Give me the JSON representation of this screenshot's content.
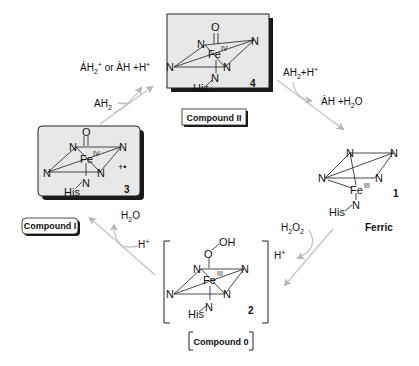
{
  "diagram": {
    "type": "catalytic-cycle",
    "arrow_color": "#c8c8c8",
    "box_fill": "#e8e8e8",
    "compounds": [
      {
        "id": "4",
        "number": "4",
        "label": "Compound II",
        "oxidation_state": "IV",
        "axial_top": "O",
        "axial_bottom": "N",
        "proximal_ligand": "His",
        "equatorial": [
          "N",
          "N",
          "N",
          "N"
        ],
        "metal": "Fe",
        "boxed": true
      },
      {
        "id": "1",
        "number": "1",
        "label": "Ferric",
        "oxidation_state": "III",
        "axial_bottom": "N",
        "proximal_ligand": "His",
        "equatorial": [
          "N",
          "N",
          "N",
          "N"
        ],
        "metal": "Fe",
        "boxed": false
      },
      {
        "id": "2",
        "number": "2",
        "label": "Compound 0",
        "oxidation_state": "III",
        "axial_top": "O",
        "axial_top_group": "OH",
        "axial_bottom": "N",
        "proximal_ligand": "His",
        "equatorial": [
          "N",
          "N",
          "N",
          "N"
        ],
        "metal": "Fe",
        "bracketed": true
      },
      {
        "id": "3",
        "number": "3",
        "label": "Compound I",
        "oxidation_state": "IV",
        "radical_cation": "+•",
        "axial_top": "O",
        "axial_bottom": "N",
        "proximal_ligand": "His",
        "equatorial": [
          "N",
          "N",
          "N",
          "N"
        ],
        "metal": "Fe",
        "boxed": true
      }
    ],
    "steps": [
      {
        "from": "1",
        "to": "2",
        "in": "H2O2",
        "out": "H+"
      },
      {
        "from": "2",
        "to": "3",
        "in": "H+",
        "out": "H2O"
      },
      {
        "from": "3",
        "to": "4",
        "in": "AH2",
        "out": "ȦH2+ or ȦH + H+"
      },
      {
        "from": "4",
        "to": "1",
        "in": "AH2 + H+",
        "out": "ȦH + H2O"
      }
    ]
  },
  "text": {
    "fe": "Fe",
    "n": "N",
    "o": "O",
    "oh": "OH",
    "his": "His",
    "ox4": "IV",
    "ox3": "III",
    "radical": "+•",
    "num1": "1",
    "num2": "2",
    "num3": "3",
    "num4": "4",
    "lbl_c2": "Compound II",
    "lbl_c1": "Compound I",
    "lbl_c0": "Compound 0",
    "lbl_ferric": "Ferric",
    "ah2": "AH",
    "sub2": "2",
    "h_plus": "H",
    "plus": "+",
    "h2o_h": "H",
    "h2o_o": "O",
    "h2o2_o": "O",
    "top_left_out_a": "ȦH",
    "top_left_out_b": "or ȦH  +H",
    "ah_dot": "ȦH",
    "plus_h2o": "+H",
    "plus_sep": "+H"
  }
}
